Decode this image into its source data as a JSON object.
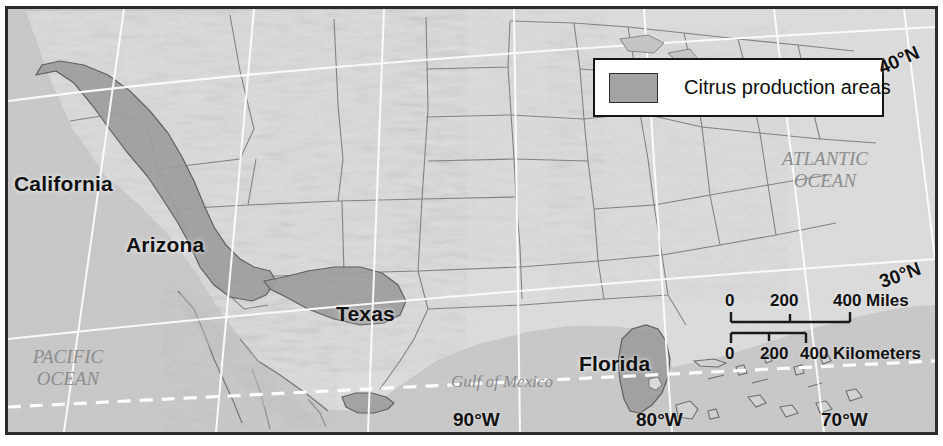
{
  "map": {
    "title": "Citrus production areas in the United States",
    "type": "thematic-reference-map",
    "projection_note": "conic",
    "colors": {
      "land": "#d8d8d8",
      "water": "#c6c6c6",
      "citrus_fill": "#9a9a9a",
      "border_frame": "#2b2b2b",
      "graticule": "#ffffff",
      "state_border": "#6e6e6e",
      "label_text": "#111111",
      "water_label_text": "#8d8d8d",
      "legend_background": "#ffffff"
    }
  },
  "legend": {
    "swatch_name": "citrus-swatch",
    "label": "Citrus production areas"
  },
  "state_labels": [
    {
      "name": "california",
      "text": "California"
    },
    {
      "name": "arizona",
      "text": "Arizona"
    },
    {
      "name": "texas",
      "text": "Texas"
    },
    {
      "name": "florida",
      "text": "Florida"
    }
  ],
  "water_labels": [
    {
      "name": "pacific-ocean",
      "line1": "PACIFIC",
      "line2": "OCEAN"
    },
    {
      "name": "atlantic-ocean",
      "line1": "ATLANTIC",
      "line2": "OCEAN"
    }
  ],
  "gulf_label": {
    "text": "Gulf of Mexico"
  },
  "graticule": {
    "latitudes": [
      {
        "text": "40°N"
      },
      {
        "text": "30°N"
      }
    ],
    "longitudes": [
      {
        "text": "90°W"
      },
      {
        "text": "80°W"
      },
      {
        "text": "70°W"
      }
    ]
  },
  "scale_bar": {
    "miles": {
      "ticks": [
        "0",
        "200",
        "400"
      ],
      "unit": "Miles",
      "unit_label": "400 Miles"
    },
    "kilometers": {
      "ticks": [
        "0",
        "200",
        "400"
      ],
      "unit": "Kilometers",
      "unit_label": "400 Kilometers"
    }
  }
}
